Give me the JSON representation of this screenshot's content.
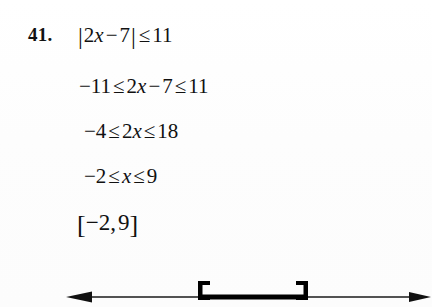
{
  "problem": {
    "number_label": "41.",
    "lines": [
      {
        "id": "line-1",
        "text": "|2x − 7| ≤ 11",
        "parts": {
          "bar_open": "|",
          "coef": "2",
          "var": "x",
          "minus": "−",
          "const": "7",
          "bar_close": "|",
          "rel": "≤",
          "bound": "11"
        }
      },
      {
        "id": "line-2",
        "text": "−11 ≤ 2x − 7 ≤ 11",
        "parts": {
          "lower": "−11",
          "rel_left": "≤",
          "coef": "2",
          "var": "x",
          "minus": "−",
          "const": "7",
          "rel_right": "≤",
          "upper": "11"
        }
      },
      {
        "id": "line-3",
        "text": "−4 ≤ 2x ≤ 18",
        "parts": {
          "lower": "−4",
          "rel_left": "≤",
          "coef": "2",
          "var": "x",
          "rel_right": "≤",
          "upper": "18"
        }
      },
      {
        "id": "line-4",
        "text": "−2 ≤ x ≤ 9",
        "parts": {
          "lower": "−2",
          "rel_left": "≤",
          "var": "x",
          "rel_right": "≤",
          "upper": "9"
        }
      },
      {
        "id": "line-5",
        "text": "[−2, 9]",
        "parts": {
          "bracket_open": "[",
          "lower": "−2",
          "comma": ",",
          "upper": "9",
          "bracket_close": "]"
        }
      }
    ]
  },
  "number_line": {
    "axis_color": "#1a1a1a",
    "interval_color": "#000000",
    "left_arrow": "arrow-left",
    "right_arrow": "arrow-right",
    "left_endpoint_type": "closed-bracket",
    "right_endpoint_type": "closed-bracket",
    "interval_notation": "[−2, 9]",
    "endpoints": [
      -2,
      9
    ]
  }
}
